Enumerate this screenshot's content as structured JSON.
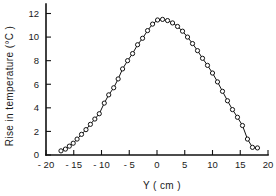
{
  "chart_data": {
    "type": "line",
    "title": "",
    "subtitle": "",
    "xlabel": "Y ( cm )",
    "ylabel": "Rise in temperature (°C )",
    "xlim": [
      -20,
      20
    ],
    "ylim": [
      0,
      13
    ],
    "grid": false,
    "legend": null,
    "marker": "open-circle",
    "xticks": [
      -20,
      -15,
      -10,
      -5,
      0,
      5,
      10,
      15,
      20
    ],
    "xticklabels": [
      "- 20",
      "- 15",
      "- 10",
      "- 5",
      "0",
      "5",
      "10",
      "15",
      "20"
    ],
    "yticks": [
      0,
      2,
      4,
      6,
      8,
      10,
      12
    ],
    "yticklabels": [
      "0",
      "2",
      "4",
      "6",
      "8",
      "10",
      "12"
    ],
    "series": [
      {
        "name": "Rise in temperature",
        "x": [
          -17.3,
          -16.5,
          -15.8,
          -15.1,
          -14.4,
          -13.6,
          -12.8,
          -12.0,
          -11.2,
          -10.4,
          -9.5,
          -8.7,
          -7.8,
          -7.0,
          -6.2,
          -5.3,
          -4.4,
          -3.5,
          -2.6,
          -1.7,
          -0.8,
          0.1,
          1.0,
          1.9,
          2.8,
          3.7,
          4.6,
          5.5,
          6.4,
          7.3,
          8.2,
          9.1,
          10.0,
          10.9,
          11.8,
          12.7,
          13.6,
          14.5,
          15.4,
          16.3,
          17.2,
          18.1
        ],
        "y": [
          0.35,
          0.5,
          0.75,
          1.0,
          1.35,
          1.75,
          2.15,
          2.6,
          3.05,
          3.5,
          4.4,
          5.1,
          5.7,
          6.45,
          7.3,
          8.0,
          8.6,
          9.35,
          9.9,
          10.55,
          11.1,
          11.45,
          11.5,
          11.4,
          11.2,
          10.9,
          10.5,
          10.0,
          9.45,
          8.85,
          8.2,
          7.6,
          6.95,
          6.2,
          5.4,
          4.6,
          3.85,
          3.2,
          2.5,
          1.35,
          0.65,
          0.6
        ]
      }
    ]
  },
  "axes": {
    "y_title": "Rise in temperature (°C )",
    "x_title": "Y ( cm )"
  },
  "colors": {
    "line": "#111111",
    "marker_fill": "#ffffff",
    "axis": "#111111",
    "background": "#ffffff"
  }
}
